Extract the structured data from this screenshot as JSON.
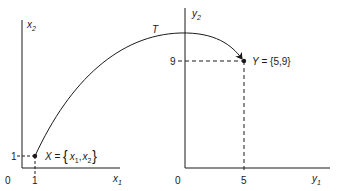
{
  "diagram": {
    "left_space": {
      "y_axis_label": "x",
      "y_axis_sub": "2",
      "x_axis_label": "x",
      "x_axis_sub": "1",
      "origin_label": "0",
      "x_tick": "1",
      "y_tick": "1",
      "point": {
        "name": "X",
        "eq": " = ",
        "open": "{",
        "comp1": "x",
        "comp1_sub": "1",
        "sep": ",",
        "comp2": "x",
        "comp2_sub": "2",
        "close": "}",
        "coords": [
          1,
          1
        ]
      }
    },
    "right_space": {
      "y_axis_label": "y",
      "y_axis_sub": "2",
      "x_axis_label": "y",
      "x_axis_sub": "1",
      "origin_label": "0",
      "x_tick": "5",
      "y_tick": "9",
      "point": {
        "name": "Y",
        "eq": " = ",
        "value": "{5,9}",
        "coords": [
          5,
          9
        ]
      }
    },
    "mapping": {
      "label": "T",
      "from": "X",
      "to": "Y"
    },
    "colors": {
      "ink": "#1a1a1a",
      "background": "#ffffff"
    }
  }
}
